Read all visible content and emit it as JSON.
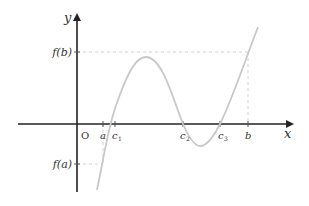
{
  "diagram": {
    "type": "function-graph",
    "axes": {
      "x_label": "x",
      "y_label": "y",
      "origin_label": "O"
    },
    "x_ticks": [
      {
        "id": "a",
        "label": "a",
        "sub": ""
      },
      {
        "id": "c1",
        "label": "c",
        "sub": "1"
      },
      {
        "id": "c2",
        "label": "c",
        "sub": "2"
      },
      {
        "id": "c3",
        "label": "c",
        "sub": "3"
      },
      {
        "id": "b",
        "label": "b",
        "sub": ""
      }
    ],
    "y_ticks": [
      {
        "id": "fb",
        "label": "f(b)"
      },
      {
        "id": "fa",
        "label": "f(a)"
      }
    ],
    "colors": {
      "axis": "#222222",
      "curve": "#c8c8c8",
      "guide": "#d0d0d0",
      "text": "#333333"
    }
  }
}
